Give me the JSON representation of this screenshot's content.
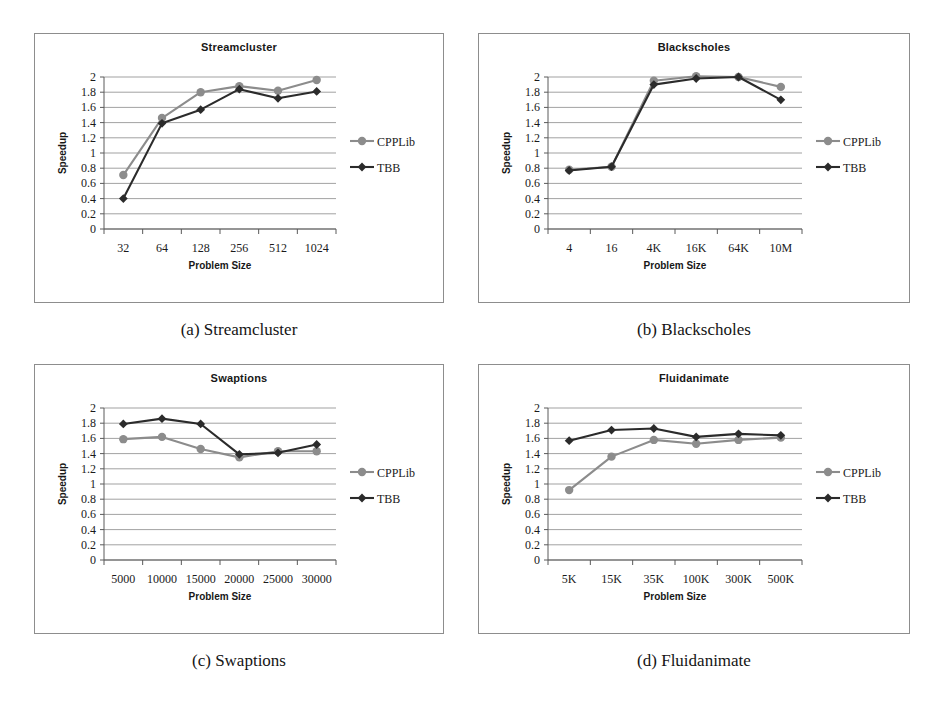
{
  "figure": {
    "series_names": [
      "CPPLib",
      "TBB"
    ],
    "series_colors": [
      "#8c8c8c",
      "#2b2b2b"
    ],
    "axis": {
      "y_label": "Speedup",
      "x_label": "Problem Size",
      "y_ticks": [
        "0",
        "0.2",
        "0.4",
        "0.6",
        "0.8",
        "1",
        "1.2",
        "1.4",
        "1.6",
        "1.8",
        "2"
      ],
      "y_min": 0,
      "y_max": 2
    },
    "captions": [
      "(a) Streamcluster",
      "(b) Blackscholes",
      "(c) Swaptions",
      "(d) Fluidanimate"
    ]
  },
  "chart_data": [
    {
      "type": "line",
      "title": "Streamcluster",
      "xlabel": "Problem Size",
      "ylabel": "Speedup",
      "ylim": [
        0,
        2
      ],
      "grid": true,
      "legend_position": "right",
      "categories": [
        "32",
        "64",
        "128",
        "256",
        "512",
        "1024"
      ],
      "series": [
        {
          "name": "CPPLib",
          "values": [
            0.71,
            1.46,
            1.8,
            1.88,
            1.82,
            1.96
          ]
        },
        {
          "name": "TBB",
          "values": [
            0.4,
            1.39,
            1.57,
            1.84,
            1.72,
            1.81
          ]
        }
      ]
    },
    {
      "type": "line",
      "title": "Blackscholes",
      "xlabel": "Problem Size",
      "ylabel": "Speedup",
      "ylim": [
        0,
        2
      ],
      "grid": true,
      "legend_position": "right",
      "categories": [
        "4",
        "16",
        "4K",
        "16K",
        "64K",
        "10M"
      ],
      "series": [
        {
          "name": "CPPLib",
          "values": [
            0.78,
            0.82,
            1.95,
            2.01,
            2.0,
            1.87
          ]
        },
        {
          "name": "TBB",
          "values": [
            0.77,
            0.82,
            1.9,
            1.98,
            2.0,
            1.7
          ]
        }
      ]
    },
    {
      "type": "line",
      "title": "Swaptions",
      "xlabel": "Problem Size",
      "ylabel": "Speedup",
      "ylim": [
        0,
        2
      ],
      "grid": true,
      "legend_position": "right",
      "categories": [
        "5000",
        "10000",
        "15000",
        "20000",
        "25000",
        "30000"
      ],
      "series": [
        {
          "name": "CPPLib",
          "values": [
            1.59,
            1.62,
            1.46,
            1.35,
            1.43,
            1.43
          ]
        },
        {
          "name": "TBB",
          "values": [
            1.79,
            1.86,
            1.79,
            1.39,
            1.41,
            1.52
          ]
        }
      ]
    },
    {
      "type": "line",
      "title": "Fluidanimate",
      "xlabel": "Problem Size",
      "ylabel": "Speedup",
      "ylim": [
        0,
        2
      ],
      "grid": true,
      "legend_position": "right",
      "categories": [
        "5K",
        "15K",
        "35K",
        "100K",
        "300K",
        "500K"
      ],
      "series": [
        {
          "name": "CPPLib",
          "values": [
            0.92,
            1.36,
            1.58,
            1.53,
            1.58,
            1.61
          ]
        },
        {
          "name": "TBB",
          "values": [
            1.57,
            1.71,
            1.73,
            1.62,
            1.66,
            1.64
          ]
        }
      ]
    }
  ]
}
